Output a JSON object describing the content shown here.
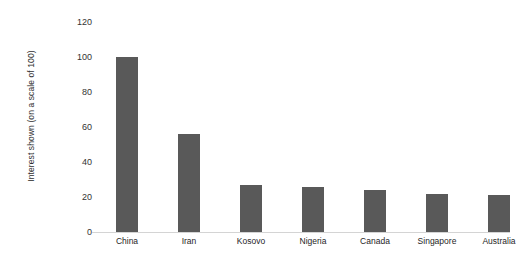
{
  "chart_data": {
    "type": "bar",
    "title": "",
    "subtitle": "",
    "xlabel": "",
    "ylabel": "Interest shown (on a scale of 100)",
    "categories": [
      "China",
      "Iran",
      "Kosovo",
      "Nigeria",
      "Canada",
      "Singapore",
      "Australia"
    ],
    "values": [
      100,
      56,
      27,
      26,
      24,
      22,
      21
    ],
    "series": [
      {
        "name": "Interest shown",
        "values": [
          100,
          56,
          27,
          26,
          24,
          22,
          21
        ]
      }
    ],
    "ylim": [
      0,
      120
    ],
    "ytick_labels": [
      "0",
      "20",
      "40",
      "60",
      "80",
      "100",
      "120"
    ],
    "ytick_values": [
      0,
      20,
      40,
      60,
      80,
      100,
      120
    ],
    "grid": false,
    "legend": false,
    "legend_position": "none",
    "bar_color": "#595959",
    "axis_line_color": "#d4d4d4",
    "background_color": "#ffffff",
    "text_color": "#333333"
  }
}
